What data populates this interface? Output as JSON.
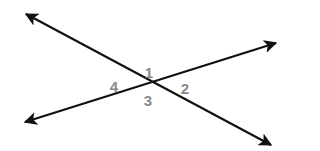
{
  "diagram": {
    "line_color": "#111111",
    "label_color": "#8a8a8a",
    "lines": [
      {
        "name": "line-a",
        "from": [
          26,
          14
        ],
        "to": [
          271,
          145
        ]
      },
      {
        "name": "line-b",
        "from": [
          25,
          122
        ],
        "to": [
          276,
          43
        ]
      }
    ],
    "intersection": [
      147,
      82
    ],
    "angles": [
      {
        "label": "1",
        "x": 149,
        "y": 72
      },
      {
        "label": "2",
        "x": 185,
        "y": 88
      },
      {
        "label": "3",
        "x": 148,
        "y": 100
      },
      {
        "label": "4",
        "x": 114,
        "y": 86
      }
    ]
  }
}
